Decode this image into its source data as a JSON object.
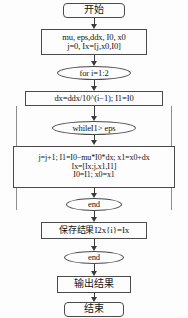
{
  "diagram": {
    "nodes": [
      {
        "id": "start",
        "type": "terminal",
        "lines": [
          "开始"
        ]
      },
      {
        "id": "init",
        "type": "process",
        "lines": [
          "mu, eps,ddx, I0, x0",
          "j=0, Ix=[j,x0,I0]"
        ]
      },
      {
        "id": "for-loop",
        "type": "oval",
        "lines": [
          "for i=1:2"
        ]
      },
      {
        "id": "dx-calc",
        "type": "process",
        "lines": [
          "dx=ddx/10^(i−1); I1=I0"
        ]
      },
      {
        "id": "while-cond",
        "type": "oval",
        "lines": [
          "whileI1> eps"
        ]
      },
      {
        "id": "loop-body",
        "type": "process",
        "lines": [
          "j=j+1; I1=I0−mu*I0*dx; x1=x0+dx",
          "Ix=[Ix;j,x1,I1]",
          "I0=I1; x0=x1"
        ]
      },
      {
        "id": "end-while",
        "type": "oval",
        "lines": [
          "end"
        ]
      },
      {
        "id": "save",
        "type": "process",
        "lines": [
          "保存结果I2x{i}=Ix"
        ]
      },
      {
        "id": "end-for",
        "type": "oval",
        "lines": [
          "end"
        ]
      },
      {
        "id": "output",
        "type": "process",
        "lines": [
          "输出结果"
        ]
      },
      {
        "id": "finish",
        "type": "terminal",
        "lines": [
          "结束"
        ]
      }
    ],
    "colors": {
      "stroke": "#4a4a4a",
      "fill": "#fdfdfd",
      "text": "#141414",
      "connector": "#3a3a3a"
    }
  }
}
